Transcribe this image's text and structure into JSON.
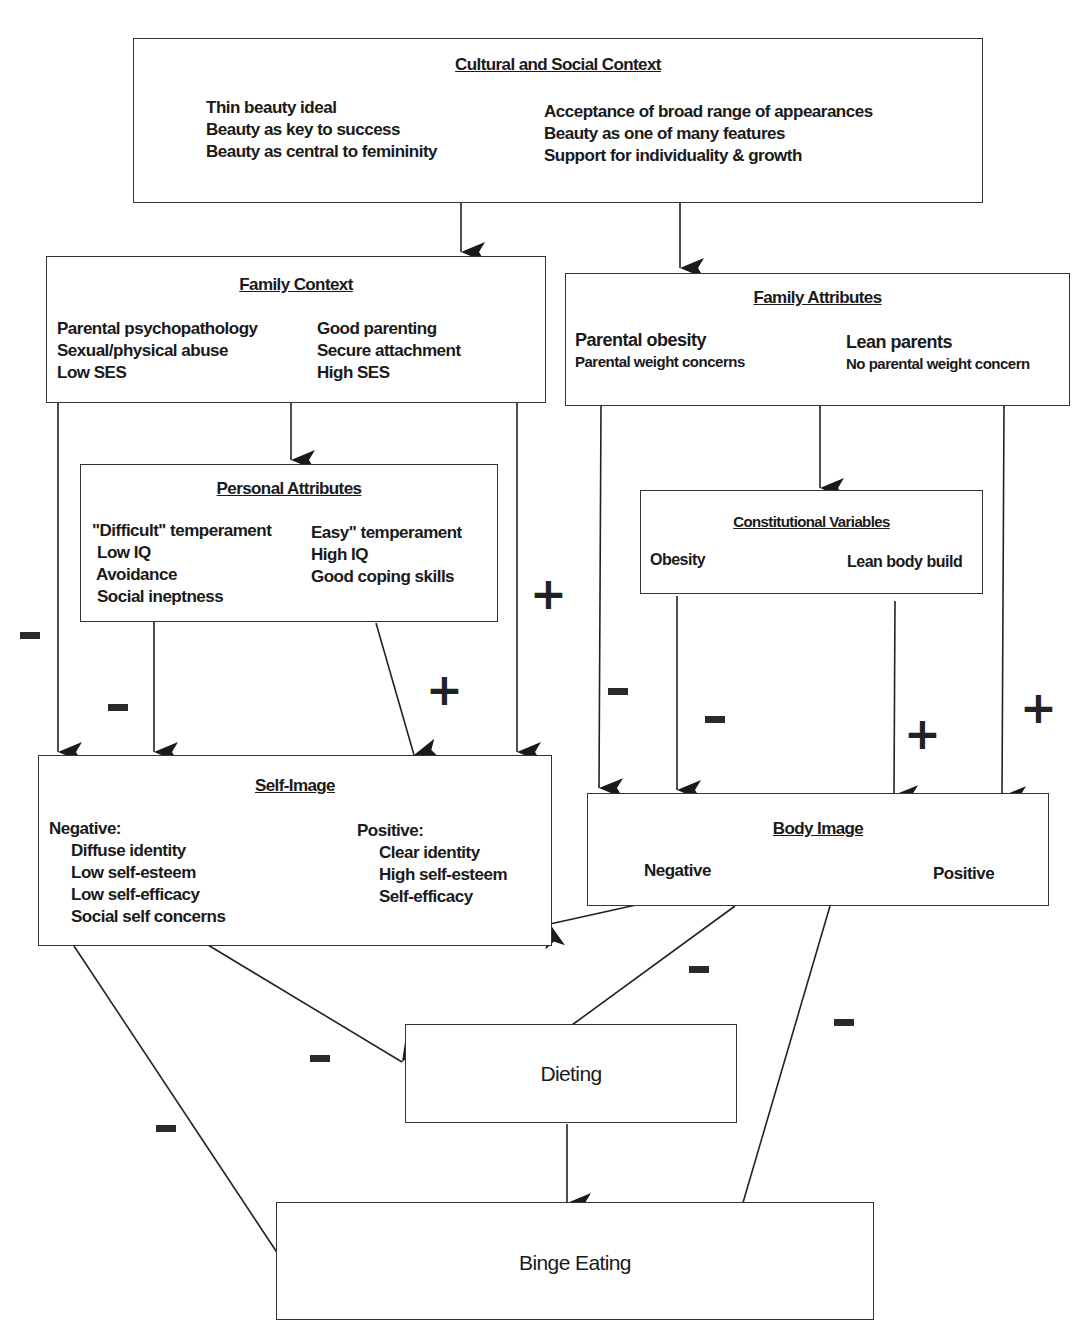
{
  "diagram": {
    "nodes": {
      "cultural": {
        "title": "Cultural and Social Context",
        "left": [
          "Thin beauty ideal",
          "Beauty as key to success",
          "Beauty as central to femininity"
        ],
        "right": [
          "Acceptance of broad range of appearances",
          "Beauty as one of many features",
          "Support for individuality & growth"
        ]
      },
      "family_context": {
        "title": "Family Context",
        "left": [
          "Parental psychopathology",
          "Sexual/physical abuse",
          "Low SES"
        ],
        "right": [
          "Good parenting",
          "Secure attachment",
          "High SES"
        ]
      },
      "family_attributes": {
        "title": "Family Attributes",
        "left": [
          "Parental obesity",
          "Parental weight concerns"
        ],
        "right": [
          "Lean parents",
          "No parental weight concern"
        ]
      },
      "personal": {
        "title": "Personal Attributes",
        "left": [
          "\"Difficult\" temperament",
          "Low IQ",
          "Avoidance",
          "Social ineptness"
        ],
        "right": [
          "Easy\" temperament",
          "High IQ",
          "Good coping skills"
        ]
      },
      "constitutional": {
        "title": "Constitutional Variables",
        "left": [
          "Obesity"
        ],
        "right": [
          "Lean body build"
        ]
      },
      "self_image": {
        "title": "Self-Image",
        "left_header": "Negative:",
        "left": [
          "Diffuse identity",
          "Low self-esteem",
          "Low self-efficacy",
          "Social self concerns"
        ],
        "right_header": "Positive:",
        "right": [
          "Clear identity",
          "High self-esteem",
          "Self-efficacy"
        ]
      },
      "body_image": {
        "title": "Body Image",
        "left": [
          "Negative"
        ],
        "right": [
          "Positive"
        ]
      },
      "dieting": {
        "label": "Dieting"
      },
      "binge": {
        "label": "Binge Eating"
      }
    },
    "signs": {
      "fc_left_to_self": "-",
      "pa_left_to_self": "-",
      "pa_right_to_self": "+",
      "fc_right_to_self": "+",
      "fa_left_to_body": "-",
      "cv_left_to_body": "-",
      "cv_right_to_body": "+",
      "fa_right_to_body": "+",
      "body_to_dieting": "-",
      "body_to_binge": "-",
      "self_to_dieting": "-",
      "self_to_binge": "-"
    },
    "edges": [
      {
        "from": "cultural",
        "to": "family_context"
      },
      {
        "from": "cultural",
        "to": "family_attributes"
      },
      {
        "from": "family_context",
        "to": "personal"
      },
      {
        "from": "family_context",
        "to": "self_image",
        "sign": "-"
      },
      {
        "from": "family_context",
        "to": "self_image",
        "sign": "+"
      },
      {
        "from": "personal",
        "to": "self_image",
        "sign": "-"
      },
      {
        "from": "personal",
        "to": "self_image",
        "sign": "+"
      },
      {
        "from": "family_attributes",
        "to": "constitutional"
      },
      {
        "from": "family_attributes",
        "to": "body_image",
        "sign": "-"
      },
      {
        "from": "family_attributes",
        "to": "body_image",
        "sign": "+"
      },
      {
        "from": "constitutional",
        "to": "body_image",
        "sign": "-"
      },
      {
        "from": "constitutional",
        "to": "body_image",
        "sign": "+"
      },
      {
        "from": "body_image",
        "to": "self_image"
      },
      {
        "from": "body_image",
        "to": "dieting",
        "sign": "-"
      },
      {
        "from": "body_image",
        "to": "binge",
        "sign": "-"
      },
      {
        "from": "self_image",
        "to": "dieting",
        "sign": "-"
      },
      {
        "from": "self_image",
        "to": "binge",
        "sign": "-"
      },
      {
        "from": "dieting",
        "to": "binge"
      }
    ]
  }
}
